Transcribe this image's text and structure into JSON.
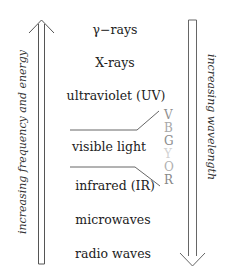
{
  "diagram": {
    "bands": [
      {
        "label": "γ−rays",
        "y": 30
      },
      {
        "label": "X-rays",
        "y": 63
      },
      {
        "label": "ultraviolet (UV)",
        "y": 96
      },
      {
        "label": "visible light",
        "y": 147
      },
      {
        "label": "infrared (IR)",
        "y": 185
      },
      {
        "label": "microwaves",
        "y": 220
      },
      {
        "label": "radio waves",
        "y": 254
      }
    ],
    "visible_colors": [
      {
        "letter": "V",
        "color": "#9a9a9a"
      },
      {
        "letter": "B",
        "color": "#a8a8a8"
      },
      {
        "letter": "G",
        "color": "#8c8c8c"
      },
      {
        "letter": "Y",
        "color": "#cfcfcf"
      },
      {
        "letter": "O",
        "color": "#b2b2b2"
      },
      {
        "letter": "R",
        "color": "#8a8a8a"
      }
    ],
    "left_arrow_label": "increasing frequency and energy",
    "right_arrow_label": "increasing wavelength"
  }
}
